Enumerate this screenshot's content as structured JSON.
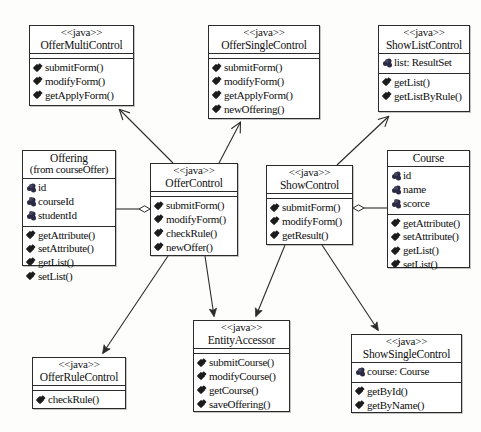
{
  "diagram": {
    "type": "uml-class-diagram",
    "stereotype_label": "<<java>>",
    "background": "#fdfdfb",
    "line_color": "#2b2b2b"
  },
  "classes": [
    {
      "id": "offer-multi-control",
      "stereotype": "<<java>>",
      "name": "OfferMultiControl",
      "subtitle": "",
      "attributes": [],
      "operations": [
        "submitForm()",
        "modifyForm()",
        "getApplyForm()"
      ],
      "box": {
        "x": 29,
        "y": 25,
        "w": 105,
        "h": 81
      }
    },
    {
      "id": "offer-single-control",
      "stereotype": "<<java>>",
      "name": "OfferSingleControl",
      "subtitle": "",
      "attributes": [],
      "operations": [
        "submitForm()",
        "modifyForm()",
        "getApplyForm()",
        "newOffering()"
      ],
      "box": {
        "x": 208,
        "y": 25,
        "w": 112,
        "h": 94
      }
    },
    {
      "id": "show-list-control",
      "stereotype": "<<java>>",
      "name": "ShowListControl",
      "subtitle": "",
      "attributes": [
        "list: ResultSet"
      ],
      "operations": [
        "getList()",
        "getListByRule()"
      ],
      "box": {
        "x": 378,
        "y": 25,
        "w": 92,
        "h": 87
      }
    },
    {
      "id": "offering",
      "stereotype": "",
      "name": "Offering",
      "subtitle": "(from courseOffer)",
      "attributes": [
        "id",
        "courseId",
        "studentId"
      ],
      "operations": [
        "getAttribute()",
        "setAttribute()",
        "getList()",
        "setList()"
      ],
      "box": {
        "x": 22,
        "y": 150,
        "w": 94,
        "h": 116
      }
    },
    {
      "id": "offer-control",
      "stereotype": "<<java>>",
      "name": "OfferControl",
      "subtitle": "",
      "attributes": [],
      "operations": [
        "submitForm()",
        "modifyForm()",
        "checkRule()",
        "newOffer()"
      ],
      "box": {
        "x": 150,
        "y": 163,
        "w": 88,
        "h": 93
      }
    },
    {
      "id": "show-control",
      "stereotype": "<<java>>",
      "name": "ShowControl",
      "subtitle": "",
      "attributes": [],
      "operations": [
        "submitForm()",
        "modifyForm()",
        "getResult()"
      ],
      "box": {
        "x": 266,
        "y": 165,
        "w": 87,
        "h": 80
      }
    },
    {
      "id": "course",
      "stereotype": "",
      "name": "Course",
      "subtitle": "",
      "attributes": [
        "id",
        "name",
        "scorce"
      ],
      "operations": [
        "getAttribute()",
        "setAttribute()",
        "getList()",
        "setList()"
      ],
      "box": {
        "x": 387,
        "y": 150,
        "w": 83,
        "h": 118
      }
    },
    {
      "id": "offer-rule-control",
      "stereotype": "<<java>>",
      "name": "OfferRuleControl",
      "subtitle": "",
      "attributes": [],
      "operations": [
        "checkRule()"
      ],
      "box": {
        "x": 32,
        "y": 357,
        "w": 94,
        "h": 52
      }
    },
    {
      "id": "entity-accessor",
      "stereotype": "<<java>>",
      "name": "EntityAccessor",
      "subtitle": "",
      "attributes": [],
      "operations": [
        "submitCourse()",
        "modifyCourse()",
        "getCourse()",
        "saveOffering()"
      ],
      "box": {
        "x": 193,
        "y": 320,
        "w": 97,
        "h": 92
      }
    },
    {
      "id": "show-single-control",
      "stereotype": "<<java>>",
      "name": "ShowSingleControl",
      "subtitle": "",
      "attributes": [
        "course: Course"
      ],
      "operations": [
        "getById()",
        "getByName()"
      ],
      "box": {
        "x": 351,
        "y": 334,
        "w": 111,
        "h": 79
      }
    }
  ],
  "relations": [
    {
      "id": "rel-offercontrol-offermulticontrol",
      "from": "offer-control",
      "to": "offer-multi-control",
      "kind": "dependency-open-arrow"
    },
    {
      "id": "rel-offercontrol-offersinglecontrol",
      "from": "offer-control",
      "to": "offer-single-control",
      "kind": "dependency-open-arrow"
    },
    {
      "id": "rel-offering-offercontrol",
      "from": "offering",
      "to": "offer-control",
      "kind": "aggregation-hollow-diamond"
    },
    {
      "id": "rel-offercontrol-offerrulecontrol",
      "from": "offer-control",
      "to": "offer-rule-control",
      "kind": "dependency-solid-arrow"
    },
    {
      "id": "rel-offercontrol-entityaccessor",
      "from": "offer-control",
      "to": "entity-accessor",
      "kind": "dependency-solid-arrow"
    },
    {
      "id": "rel-showcontrol-showlistcontrol",
      "from": "show-control",
      "to": "show-list-control",
      "kind": "dependency-open-arrow"
    },
    {
      "id": "rel-course-showcontrol",
      "from": "course",
      "to": "show-control",
      "kind": "aggregation-hollow-diamond"
    },
    {
      "id": "rel-showcontrol-entityaccessor",
      "from": "show-control",
      "to": "entity-accessor",
      "kind": "dependency-solid-arrow"
    },
    {
      "id": "rel-showcontrol-showsinglecontrol",
      "from": "show-control",
      "to": "show-single-control",
      "kind": "dependency-solid-arrow"
    }
  ]
}
